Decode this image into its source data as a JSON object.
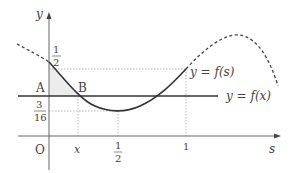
{
  "diagram": {
    "axes": {
      "y_label": "y",
      "x_label": "s",
      "origin_label": "O"
    },
    "y_ticks": [
      {
        "num": "1",
        "den": "2"
      },
      {
        "num": "3",
        "den": "16"
      }
    ],
    "x_ticks": {
      "x": "x",
      "half_num": "1",
      "half_den": "2",
      "one": "1"
    },
    "points": {
      "A": "A",
      "B": "B"
    },
    "curves": {
      "fs_label": "y = f(s)",
      "fx_label": "y = f(x)"
    },
    "colors": {
      "curve": "#333333",
      "axis": "#555555",
      "guide": "#aaaaaa",
      "shade": "#e8e8e8"
    }
  }
}
